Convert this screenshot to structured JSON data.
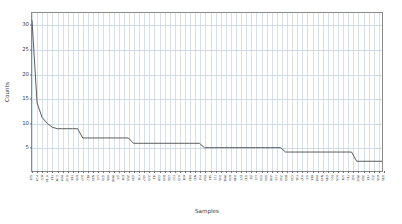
{
  "figure": {
    "background": "#ffffff",
    "line_color": "#4a4a4a",
    "grid_color": "#c9d4e0",
    "axis_color": "#8a8a8a",
    "tick_text_color": "#3c3c3c"
  },
  "axes": {
    "ylabel": "Counts",
    "xlabel": "Samples",
    "yticks": [
      5,
      10,
      15,
      20,
      25,
      30
    ],
    "ylim": [
      0,
      32.5
    ],
    "grid": true
  },
  "chart_data": {
    "type": "line",
    "title": "",
    "xlabel": "Samples",
    "ylabel": "Counts",
    "ylim": [
      0,
      32.5
    ],
    "grid": true,
    "legend": null,
    "categories": [
      "S26",
      "P-24",
      "B22",
      "H-19",
      "F14",
      "C-31",
      "M09",
      "R-07",
      "T18",
      "A05",
      "D27",
      "K12",
      "N33",
      "L02",
      "G21",
      "V16",
      "W08",
      "J29",
      "E04",
      "Z13",
      "Q30",
      "Y06",
      "U17",
      "X23",
      "I11",
      "O28",
      "B03",
      "C15",
      "F20",
      "H25",
      "K01",
      "M10",
      "N32",
      "P07",
      "R19",
      "S14",
      "T22",
      "V05",
      "W31",
      "A09",
      "D18",
      "E27",
      "G12",
      "J33",
      "L02",
      "Q21",
      "U16",
      "X08",
      "Y29",
      "Z04",
      "B13",
      "C30",
      "F06",
      "H17",
      "I23",
      "K11",
      "M28",
      "N03",
      "O15",
      "P20",
      "R25",
      "S01",
      "T10",
      "V32",
      "W07",
      "X19",
      "Y14",
      "Z22",
      "A05",
      "D31"
    ],
    "values": [
      31,
      14,
      11,
      9.8,
      9.0,
      8.7,
      8.7,
      8.7,
      8.7,
      8.7,
      6.8,
      6.8,
      6.8,
      6.8,
      6.8,
      6.8,
      6.8,
      6.8,
      6.8,
      6.8,
      5.7,
      5.7,
      5.7,
      5.7,
      5.7,
      5.7,
      5.7,
      5.7,
      5.7,
      5.7,
      5.7,
      5.7,
      5.7,
      5.7,
      4.8,
      4.8,
      4.8,
      4.8,
      4.8,
      4.8,
      4.8,
      4.8,
      4.8,
      4.8,
      4.8,
      4.8,
      4.8,
      4.8,
      4.8,
      4.8,
      3.9,
      3.9,
      3.9,
      3.9,
      3.9,
      3.9,
      3.9,
      3.9,
      3.9,
      3.9,
      3.9,
      3.9,
      3.9,
      3.9,
      2.0,
      2.0,
      2.0,
      2.0,
      2.0,
      2.0
    ]
  }
}
